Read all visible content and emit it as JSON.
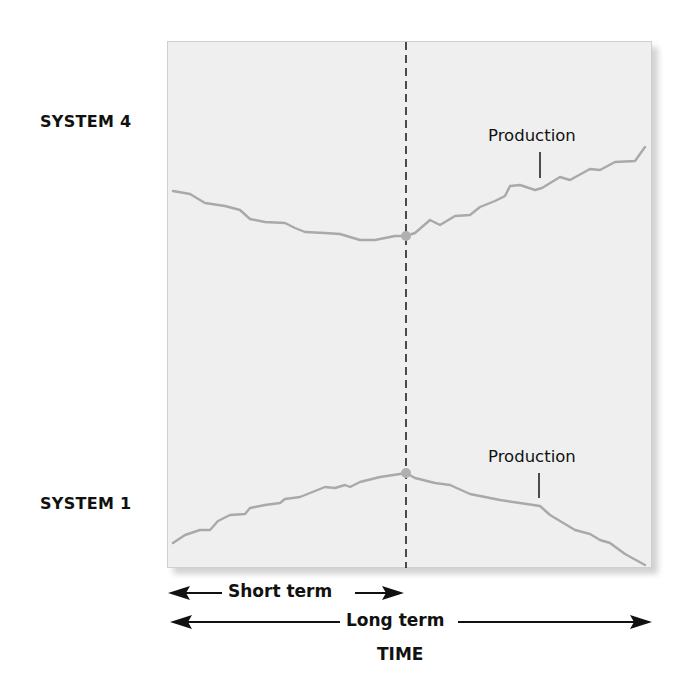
{
  "chart_data": {
    "type": "line",
    "title": "",
    "xlabel": "TIME",
    "ylabel": "",
    "grid": false,
    "legend": "none",
    "panels": [
      {
        "name": "SYSTEM 4",
        "series_label": "Production",
        "trend": "declines in the short term, rises in the long term",
        "points_px": [
          [
            173,
            191
          ],
          [
            190,
            194
          ],
          [
            205,
            203
          ],
          [
            225,
            206
          ],
          [
            240,
            210
          ],
          [
            250,
            219
          ],
          [
            265,
            222
          ],
          [
            285,
            223
          ],
          [
            295,
            228
          ],
          [
            305,
            232
          ],
          [
            325,
            233
          ],
          [
            340,
            234
          ],
          [
            360,
            240
          ],
          [
            375,
            240
          ],
          [
            395,
            236
          ],
          [
            406,
            236
          ],
          [
            415,
            233
          ],
          [
            430,
            220
          ],
          [
            440,
            225
          ],
          [
            455,
            216
          ],
          [
            470,
            215
          ],
          [
            480,
            207
          ],
          [
            495,
            201
          ],
          [
            505,
            196
          ],
          [
            510,
            186
          ],
          [
            520,
            185
          ],
          [
            535,
            190
          ],
          [
            542,
            188
          ],
          [
            560,
            177
          ],
          [
            570,
            180
          ],
          [
            590,
            169
          ],
          [
            600,
            170
          ],
          [
            615,
            162
          ],
          [
            635,
            161
          ],
          [
            645,
            147
          ]
        ],
        "marker_at_x": 406
      },
      {
        "name": "SYSTEM 1",
        "series_label": "Production",
        "trend": "rises in the short term, declines in the long term",
        "points_px": [
          [
            173,
            543
          ],
          [
            185,
            535
          ],
          [
            200,
            530
          ],
          [
            210,
            530
          ],
          [
            218,
            521
          ],
          [
            230,
            515
          ],
          [
            245,
            514
          ],
          [
            250,
            508
          ],
          [
            265,
            505
          ],
          [
            280,
            503
          ],
          [
            285,
            499
          ],
          [
            300,
            497
          ],
          [
            315,
            491
          ],
          [
            325,
            487
          ],
          [
            335,
            488
          ],
          [
            345,
            485
          ],
          [
            350,
            487
          ],
          [
            360,
            482
          ],
          [
            380,
            477
          ],
          [
            400,
            474
          ],
          [
            406,
            473
          ],
          [
            415,
            478
          ],
          [
            435,
            483
          ],
          [
            450,
            485
          ],
          [
            470,
            494
          ],
          [
            485,
            497
          ],
          [
            500,
            500
          ],
          [
            520,
            503
          ],
          [
            540,
            506
          ],
          [
            550,
            515
          ],
          [
            575,
            530
          ],
          [
            590,
            534
          ],
          [
            600,
            540
          ],
          [
            610,
            543
          ],
          [
            625,
            554
          ],
          [
            645,
            565
          ]
        ],
        "marker_at_x": 406
      }
    ],
    "annotations": [
      "Production",
      "Production"
    ],
    "time_spans": [
      {
        "label": "Short term",
        "from_px": 170,
        "to_px": 402
      },
      {
        "label": "Long term",
        "from_px": 170,
        "to_px": 650
      }
    ]
  },
  "labels": {
    "system_top": "SYSTEM 4",
    "system_bottom": "SYSTEM 1",
    "production_top": "Production",
    "production_bottom": "Production",
    "short_term": "Short term",
    "long_term": "Long term",
    "time": "TIME"
  },
  "colors": {
    "panel_bg": "#efefef",
    "line": "#a9a9a9",
    "marker": "#b0b0b0",
    "text": "#111111"
  }
}
